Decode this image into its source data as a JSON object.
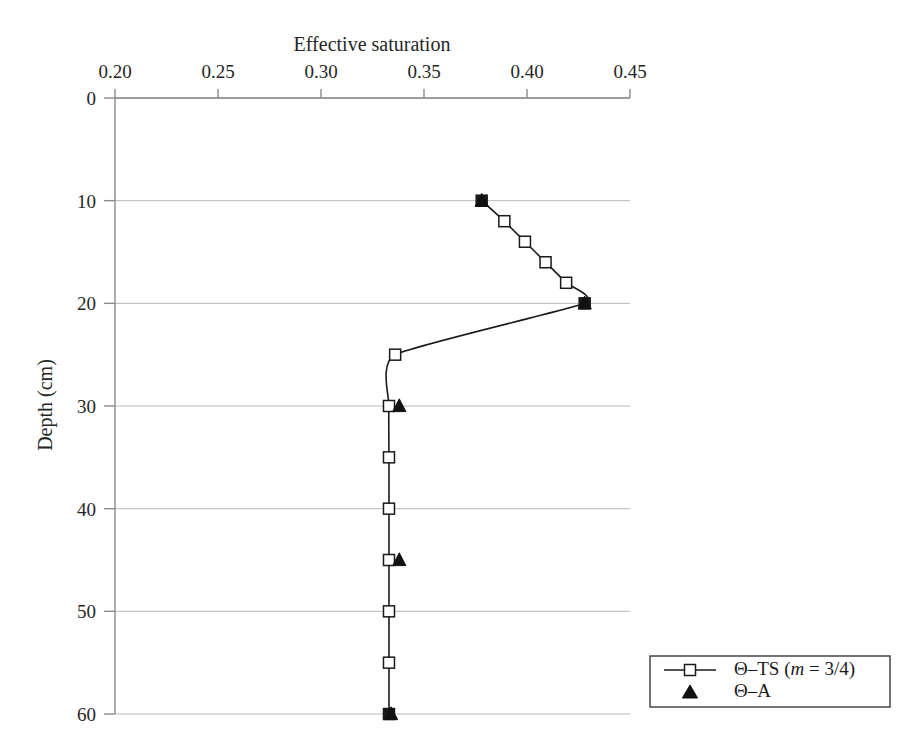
{
  "chart_data": {
    "type": "line",
    "title": "",
    "xlabel": "Effective saturation",
    "ylabel": "Depth (cm)",
    "xlim": [
      0.2,
      0.45
    ],
    "ylim": [
      0,
      60
    ],
    "y_inverted": true,
    "grid": "horizontal",
    "legend_position": "bottom-right",
    "xticks": [
      "0.20",
      "0.25",
      "0.30",
      "0.35",
      "0.40",
      "0.45"
    ],
    "xtick_values": [
      0.2,
      0.25,
      0.3,
      0.35,
      0.4,
      0.45
    ],
    "yticks": [
      "0",
      "10",
      "20",
      "30",
      "40",
      "50",
      "60"
    ],
    "ytick_values": [
      0,
      10,
      20,
      30,
      40,
      50,
      60
    ],
    "series": [
      {
        "name": "Θ–TS (m = 3/4)",
        "marker": "open-square",
        "line": true,
        "x": [
          0.378,
          0.389,
          0.399,
          0.409,
          0.419,
          0.428,
          0.336,
          0.333,
          0.333,
          0.333,
          0.333,
          0.333,
          0.333,
          0.333
        ],
        "y": [
          10,
          12,
          14,
          16,
          18,
          20,
          25,
          30,
          35,
          40,
          45,
          50,
          55,
          60
        ]
      },
      {
        "name": "Θ–A",
        "marker": "filled-triangle",
        "line": false,
        "x": [
          0.378,
          0.428,
          0.338,
          0.338,
          0.334
        ],
        "y": [
          10,
          20,
          30,
          45,
          60
        ]
      }
    ]
  },
  "legend": {
    "entries": [
      {
        "label_prefix": "Θ–TS (",
        "label_italic": "m",
        "label_suffix": " = 3/4)",
        "marker": "open-square-line"
      },
      {
        "label_prefix": "Θ–A",
        "label_italic": "",
        "label_suffix": "",
        "marker": "filled-triangle"
      }
    ]
  }
}
